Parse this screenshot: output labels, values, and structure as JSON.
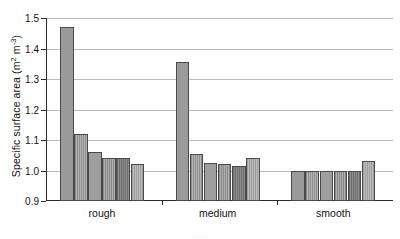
{
  "chart_data": {
    "type": "bar",
    "title": "",
    "subtitle": "",
    "xlabel": "",
    "ylabel": "Specific surface area (m² m⁻³)",
    "ylabel_parts": {
      "text_before": "Specific surface area (m",
      "sup1": "2",
      "text_mid": " m",
      "sup2": "-3",
      "text_after": ")"
    },
    "categories": [
      "rough",
      "medium",
      "smooth"
    ],
    "ylim": [
      0.9,
      1.5
    ],
    "yticks": [
      "0.9",
      "1.0",
      "1.1",
      "1.2",
      "1.3",
      "1.4",
      "1.5"
    ],
    "ytick_values": [
      0.9,
      1.0,
      1.1,
      1.2,
      1.3,
      1.4,
      1.5
    ],
    "grid": "horizontal",
    "legend_position": "none",
    "bars_per_group": 6,
    "series": [
      {
        "name": "bar-1",
        "values": [
          1.47,
          1.355,
          1.0
        ]
      },
      {
        "name": "bar-2",
        "values": [
          1.12,
          1.055,
          1.0
        ]
      },
      {
        "name": "bar-3",
        "values": [
          1.06,
          1.025,
          1.0
        ]
      },
      {
        "name": "bar-4",
        "values": [
          1.042,
          1.02,
          1.0
        ]
      },
      {
        "name": "bar-5",
        "values": [
          1.042,
          1.015,
          1.0
        ]
      },
      {
        "name": "bar-6",
        "values": [
          1.022,
          1.04,
          1.03
        ]
      }
    ],
    "groups": [
      {
        "category": "rough",
        "values": [
          1.47,
          1.12,
          1.06,
          1.042,
          1.042,
          1.022
        ],
        "fills": [
          "solid",
          "hatch",
          "solid2",
          "hatch2",
          "dark",
          "light"
        ]
      },
      {
        "category": "medium",
        "values": [
          1.355,
          1.055,
          1.025,
          1.02,
          1.015,
          1.04
        ],
        "fills": [
          "solid",
          "hatch",
          "solid2",
          "hatch2",
          "dark",
          "light"
        ]
      },
      {
        "category": "smooth",
        "values": [
          1.0,
          1.0,
          1.0,
          1.0,
          1.0,
          1.03
        ],
        "fills": [
          "solid",
          "hatch",
          "solid2",
          "hatch2",
          "dark",
          "light"
        ]
      }
    ],
    "colors": {
      "bar_solid": "#9a9a9a",
      "bar_dark": "#6d6d6d",
      "bar_light": "#bdbdbd",
      "bar_edge": "#4a4a4a",
      "gridline": "#b9b9b9",
      "axis": "#2b2b2b",
      "background": "#ffffff",
      "text": "#111111"
    }
  },
  "caption": {
    "text": "......."
  }
}
